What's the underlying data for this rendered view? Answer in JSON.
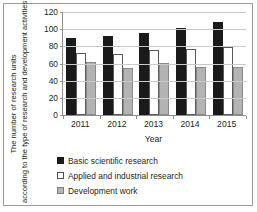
{
  "chart_data": {
    "type": "bar",
    "title": "",
    "xlabel": "Year",
    "ylabel": "The number of research units according to the type of research and development activities",
    "ylabel_lines": [
      "The number of research units",
      "according to the type of research and development activities"
    ],
    "categories": [
      "2011",
      "2012",
      "2013",
      "2014",
      "2015"
    ],
    "series": [
      {
        "name": "Basic scientific research",
        "values": [
          90,
          92,
          96,
          101,
          108
        ],
        "color": "#1a1a1a"
      },
      {
        "name": "Applied and industrial research",
        "values": [
          72,
          71,
          76,
          77,
          79
        ],
        "color": "#ffffff"
      },
      {
        "name": "Development work",
        "values": [
          62,
          55,
          61,
          56,
          56
        ],
        "color": "#b3b3b3"
      }
    ],
    "ylim": [
      0,
      120
    ],
    "yticks": [
      0,
      20,
      40,
      60,
      80,
      100,
      120
    ],
    "ytick_labels": [
      "0",
      "20",
      "40",
      "60",
      "80",
      "100",
      "120"
    ],
    "grid": true,
    "legend_position": "bottom"
  }
}
